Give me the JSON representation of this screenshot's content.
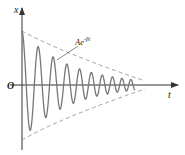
{
  "diagram": {
    "y_axis_label": "x",
    "x_axis_label": "t",
    "origin_label": "O",
    "envelope_label": "Ae",
    "envelope_exponent": "-βt",
    "colors": {
      "axis": "#333333",
      "curve": "#777777",
      "envelope": "#999999",
      "background": "#ffffff"
    }
  }
}
